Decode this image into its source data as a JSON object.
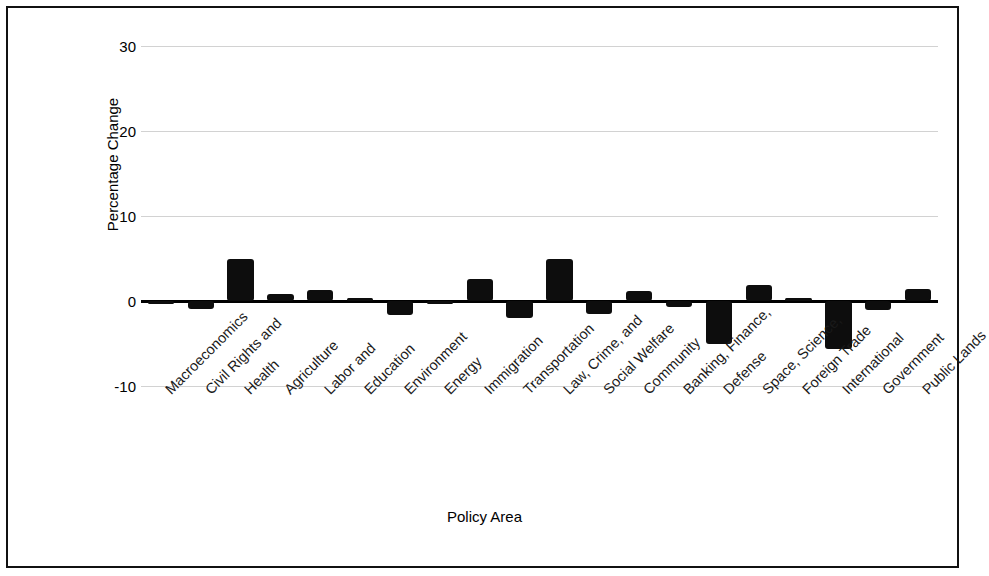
{
  "chart_data": {
    "type": "bar",
    "title": "",
    "xlabel": "Policy Area",
    "ylabel": "Percentage Change",
    "ylim": [
      -10,
      30
    ],
    "yticks": [
      30,
      20,
      10,
      0,
      -10
    ],
    "grid": true,
    "legend": "none",
    "bar_color": "#0d0d0d",
    "categories": [
      "Macroeconomics",
      "Civil Rights and",
      "Health",
      "Agriculture",
      "Labor and",
      "Education",
      "Environment",
      "Energy",
      "Immigration",
      "Transportation",
      "Law, Crime, and",
      "Social Welfare",
      "Community",
      "Banking, Finance,",
      "Defense",
      "Space, Science,",
      "Foreign Trade",
      "International",
      "Government",
      "Public Lands"
    ],
    "values": [
      -0.1,
      -0.9,
      5.0,
      0.8,
      1.3,
      0.3,
      -1.6,
      -0.1,
      2.6,
      -2.0,
      5.0,
      -1.5,
      1.2,
      -0.7,
      -5.0,
      1.9,
      0.3,
      -5.6,
      -1.1,
      1.4
    ]
  }
}
